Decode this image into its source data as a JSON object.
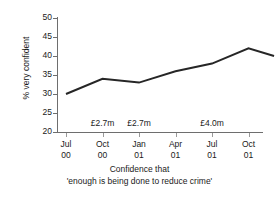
{
  "chart_data": {
    "type": "line",
    "title": "",
    "caption_line1": "Confidence that",
    "caption_line2": "'enough is being done to reduce crime'",
    "xlabel": "",
    "ylabel": "% very confident",
    "ylim": [
      20,
      50
    ],
    "ytick_labels": [
      "50",
      "45",
      "40",
      "35",
      "30",
      "25",
      "20"
    ],
    "ytick_values": [
      50,
      45,
      40,
      35,
      30,
      25,
      20
    ],
    "xtick_labels": [
      {
        "month": "Jul",
        "year": "00"
      },
      {
        "month": "Oct",
        "year": "00"
      },
      {
        "month": "Jan",
        "year": "01"
      },
      {
        "month": "Apr",
        "year": "01"
      },
      {
        "month": "Jul",
        "year": "01"
      },
      {
        "month": "Oct",
        "year": "01"
      }
    ],
    "categories": [
      "Jul 00",
      "Oct 00",
      "Jan 01",
      "Apr 01",
      "Jul 01",
      "Oct 01",
      "Jan 02"
    ],
    "x": [
      0,
      1,
      2,
      3,
      4,
      5,
      5.7
    ],
    "values": [
      30,
      34,
      33,
      36,
      38,
      42,
      40
    ],
    "grid": false,
    "legend": "none",
    "line_color": "#262626",
    "annotations": [
      {
        "label": "£2.7m",
        "x_category": "Oct 00",
        "y": 22
      },
      {
        "label": "£2.7m",
        "x_category": "Jan 01",
        "y": 22
      },
      {
        "label": "£4.0m",
        "x_category": "Jul 01",
        "y": 22
      }
    ]
  },
  "axis": {
    "y_title": "% very confident"
  },
  "colors": {
    "line": "#262626",
    "axis": "#6e6e6e",
    "text": "#1a1a1a",
    "background": "#ffffff"
  }
}
